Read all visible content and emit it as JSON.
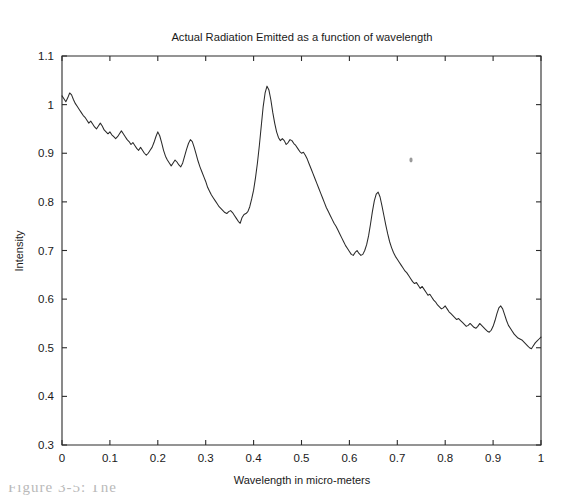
{
  "figure": {
    "background_color": "#ffffff",
    "line_color": "#2a2a2a",
    "axis_color": "#2b2b2b",
    "artifact_label": "scan-speck"
  },
  "caption": {
    "partial_text": "Figure 3-5:  The"
  },
  "chart_data": {
    "type": "line",
    "title": "Actual Radiation Emitted as a function of wavelength",
    "xlabel": "Wavelength in micro-meters",
    "ylabel": "Intensity",
    "xlim": [
      0,
      1
    ],
    "ylim": [
      0.3,
      1.1
    ],
    "xticks": [
      0,
      0.1,
      0.2,
      0.3,
      0.4,
      0.5,
      0.6,
      0.7,
      0.8,
      0.9,
      1
    ],
    "xticklabels": [
      "0",
      "0.1",
      "0.2",
      "0.3",
      "0.4",
      "0.5",
      "0.6",
      "0.7",
      "0.8",
      "0.9",
      "1"
    ],
    "yticks": [
      0.3,
      0.4,
      0.5,
      0.6,
      0.7,
      0.8,
      0.9,
      1.0,
      1.1
    ],
    "yticklabels": [
      "0.3",
      "0.4",
      "0.5",
      "0.6",
      "0.7",
      "0.8",
      "0.9",
      "1",
      "1.1"
    ],
    "grid": false,
    "legend": null,
    "series": [
      {
        "name": "Actual Radiation",
        "color": "#2a2a2a",
        "x": [
          0.0,
          0.004,
          0.008,
          0.012,
          0.016,
          0.02,
          0.024,
          0.028,
          0.032,
          0.036,
          0.04,
          0.044,
          0.048,
          0.052,
          0.056,
          0.06,
          0.064,
          0.068,
          0.072,
          0.076,
          0.08,
          0.084,
          0.088,
          0.092,
          0.096,
          0.1,
          0.104,
          0.108,
          0.112,
          0.116,
          0.12,
          0.124,
          0.128,
          0.132,
          0.136,
          0.14,
          0.144,
          0.148,
          0.152,
          0.156,
          0.16,
          0.164,
          0.168,
          0.172,
          0.176,
          0.18,
          0.184,
          0.188,
          0.192,
          0.196,
          0.2,
          0.204,
          0.208,
          0.212,
          0.216,
          0.22,
          0.224,
          0.228,
          0.232,
          0.236,
          0.24,
          0.244,
          0.248,
          0.252,
          0.256,
          0.26,
          0.264,
          0.268,
          0.272,
          0.276,
          0.28,
          0.284,
          0.288,
          0.292,
          0.296,
          0.3,
          0.304,
          0.308,
          0.312,
          0.316,
          0.32,
          0.324,
          0.328,
          0.332,
          0.336,
          0.34,
          0.344,
          0.348,
          0.352,
          0.356,
          0.36,
          0.364,
          0.368,
          0.372,
          0.376,
          0.38,
          0.384,
          0.388,
          0.392,
          0.396,
          0.4,
          0.404,
          0.408,
          0.412,
          0.416,
          0.42,
          0.424,
          0.428,
          0.432,
          0.436,
          0.44,
          0.444,
          0.448,
          0.452,
          0.456,
          0.46,
          0.464,
          0.468,
          0.472,
          0.476,
          0.48,
          0.484,
          0.488,
          0.492,
          0.496,
          0.5,
          0.504,
          0.508,
          0.512,
          0.516,
          0.52,
          0.524,
          0.528,
          0.532,
          0.536,
          0.54,
          0.544,
          0.548,
          0.552,
          0.556,
          0.56,
          0.564,
          0.568,
          0.572,
          0.576,
          0.58,
          0.584,
          0.588,
          0.592,
          0.596,
          0.6,
          0.604,
          0.608,
          0.612,
          0.616,
          0.62,
          0.624,
          0.628,
          0.632,
          0.636,
          0.64,
          0.644,
          0.648,
          0.652,
          0.656,
          0.66,
          0.664,
          0.668,
          0.672,
          0.676,
          0.68,
          0.684,
          0.688,
          0.692,
          0.696,
          0.7,
          0.704,
          0.708,
          0.712,
          0.716,
          0.72,
          0.724,
          0.728,
          0.732,
          0.736,
          0.74,
          0.744,
          0.748,
          0.752,
          0.756,
          0.76,
          0.764,
          0.768,
          0.772,
          0.776,
          0.78,
          0.784,
          0.788,
          0.792,
          0.796,
          0.8,
          0.804,
          0.808,
          0.812,
          0.816,
          0.82,
          0.824,
          0.828,
          0.832,
          0.836,
          0.84,
          0.844,
          0.848,
          0.852,
          0.856,
          0.86,
          0.864,
          0.868,
          0.872,
          0.876,
          0.88,
          0.884,
          0.888,
          0.892,
          0.896,
          0.9,
          0.904,
          0.908,
          0.912,
          0.916,
          0.92,
          0.924,
          0.928,
          0.932,
          0.936,
          0.94,
          0.944,
          0.948,
          0.952,
          0.956,
          0.96,
          0.964,
          0.968,
          0.972,
          0.976,
          0.98,
          0.984,
          0.988,
          0.992,
          0.996,
          1.0
        ],
        "y": [
          1.018,
          1.012,
          1.006,
          1.014,
          1.024,
          1.02,
          1.01,
          1.002,
          0.996,
          0.99,
          0.984,
          0.978,
          0.974,
          0.968,
          0.962,
          0.966,
          0.96,
          0.954,
          0.95,
          0.956,
          0.962,
          0.956,
          0.948,
          0.944,
          0.94,
          0.944,
          0.938,
          0.934,
          0.93,
          0.934,
          0.94,
          0.946,
          0.94,
          0.934,
          0.928,
          0.924,
          0.918,
          0.922,
          0.916,
          0.91,
          0.906,
          0.912,
          0.906,
          0.9,
          0.896,
          0.9,
          0.906,
          0.912,
          0.922,
          0.934,
          0.944,
          0.936,
          0.922,
          0.906,
          0.894,
          0.886,
          0.88,
          0.874,
          0.88,
          0.886,
          0.882,
          0.876,
          0.872,
          0.88,
          0.894,
          0.908,
          0.92,
          0.928,
          0.924,
          0.912,
          0.898,
          0.884,
          0.872,
          0.862,
          0.852,
          0.842,
          0.83,
          0.822,
          0.814,
          0.808,
          0.802,
          0.796,
          0.79,
          0.786,
          0.782,
          0.778,
          0.776,
          0.78,
          0.782,
          0.778,
          0.772,
          0.766,
          0.76,
          0.756,
          0.768,
          0.774,
          0.776,
          0.78,
          0.79,
          0.806,
          0.824,
          0.85,
          0.88,
          0.916,
          0.956,
          0.996,
          1.024,
          1.038,
          1.03,
          1.01,
          0.984,
          0.962,
          0.944,
          0.932,
          0.926,
          0.93,
          0.926,
          0.918,
          0.922,
          0.928,
          0.926,
          0.92,
          0.916,
          0.91,
          0.904,
          0.9,
          0.902,
          0.896,
          0.888,
          0.878,
          0.868,
          0.858,
          0.848,
          0.838,
          0.828,
          0.818,
          0.808,
          0.798,
          0.788,
          0.78,
          0.772,
          0.764,
          0.756,
          0.75,
          0.742,
          0.734,
          0.726,
          0.718,
          0.71,
          0.704,
          0.698,
          0.692,
          0.69,
          0.696,
          0.7,
          0.694,
          0.69,
          0.692,
          0.7,
          0.712,
          0.73,
          0.754,
          0.78,
          0.802,
          0.816,
          0.82,
          0.81,
          0.792,
          0.772,
          0.752,
          0.734,
          0.718,
          0.706,
          0.696,
          0.688,
          0.682,
          0.676,
          0.67,
          0.664,
          0.658,
          0.654,
          0.648,
          0.642,
          0.636,
          0.632,
          0.634,
          0.628,
          0.622,
          0.626,
          0.62,
          0.614,
          0.608,
          0.61,
          0.604,
          0.598,
          0.594,
          0.588,
          0.584,
          0.58,
          0.582,
          0.586,
          0.58,
          0.574,
          0.57,
          0.566,
          0.562,
          0.558,
          0.56,
          0.556,
          0.552,
          0.548,
          0.544,
          0.546,
          0.55,
          0.546,
          0.542,
          0.54,
          0.544,
          0.55,
          0.546,
          0.542,
          0.538,
          0.534,
          0.532,
          0.536,
          0.544,
          0.556,
          0.57,
          0.582,
          0.586,
          0.58,
          0.568,
          0.556,
          0.546,
          0.54,
          0.534,
          0.528,
          0.524,
          0.52,
          0.518,
          0.516,
          0.512,
          0.508,
          0.504,
          0.5,
          0.498,
          0.504,
          0.51,
          0.514,
          0.518,
          0.522
        ]
      }
    ],
    "annotations": [
      {
        "name": "primary-peak",
        "x": 0.405,
        "y": 1.04
      },
      {
        "name": "secondary-peak",
        "x": 0.553,
        "y": 0.82
      },
      {
        "name": "minor-peak-0.2",
        "x": 0.2,
        "y": 0.945
      },
      {
        "name": "minor-peak-0.26",
        "x": 0.262,
        "y": 0.928
      },
      {
        "name": "minor-peak-0.75",
        "x": 0.75,
        "y": 0.585
      },
      {
        "name": "minor-peak-0.855",
        "x": 0.855,
        "y": 0.555
      },
      {
        "name": "trough-0.345",
        "x": 0.345,
        "y": 0.756
      },
      {
        "name": "trough-0.515",
        "x": 0.517,
        "y": 0.69
      }
    ]
  }
}
